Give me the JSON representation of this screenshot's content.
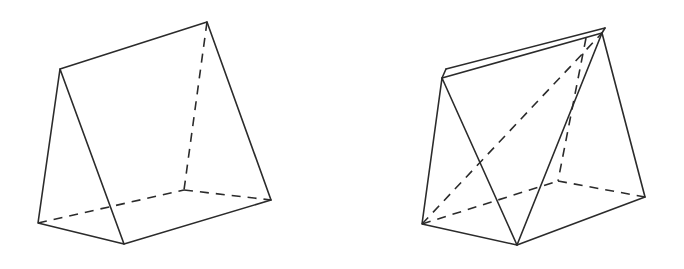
{
  "page": {
    "background_color": "#ffffff",
    "width": 684,
    "height": 269
  },
  "style": {
    "stroke_color": "#2b2b2b",
    "stroke_width": 1.6,
    "hidden_dash_pattern": "9 7",
    "fill_color": "#ffffff"
  },
  "figures": [
    {
      "id": "left-prism",
      "name": "triangular-prism-plain",
      "label": "",
      "vertices": {
        "front_apex": [
          60,
          69
        ],
        "front_bottom_left": [
          38,
          223
        ],
        "front_bottom_right": [
          124,
          244
        ],
        "back_apex": [
          207,
          22
        ],
        "back_bottom_left": [
          184,
          190
        ],
        "back_bottom_right": [
          271,
          200
        ]
      },
      "solid_edges": [
        [
          "front_apex",
          "front_bottom_left"
        ],
        [
          "front_apex",
          "front_bottom_right"
        ],
        [
          "front_bottom_left",
          "front_bottom_right"
        ],
        [
          "front_apex",
          "back_apex"
        ],
        [
          "back_apex",
          "back_bottom_right"
        ],
        [
          "front_bottom_right",
          "back_bottom_right"
        ]
      ],
      "hidden_edges": [
        [
          "back_apex",
          "back_bottom_left"
        ],
        [
          "back_bottom_left",
          "back_bottom_right"
        ],
        [
          "front_bottom_left",
          "back_bottom_left"
        ]
      ]
    },
    {
      "id": "right-prism",
      "name": "triangular-prism-with-inscribed-pyramid",
      "label": "",
      "vertices": {
        "front_apex": [
          442,
          78
        ],
        "front_apex_upper": [
          446,
          70
        ],
        "front_bottom_left": [
          422,
          224
        ],
        "front_bottom_mid": [
          517,
          245
        ],
        "back_apex": [
          602,
          33
        ],
        "back_apex_inner": [
          586,
          38
        ],
        "back_bottom_left": [
          558,
          181
        ],
        "back_bottom_right": [
          645,
          197
        ]
      },
      "solid_edges": [
        [
          "front_apex",
          "front_bottom_left"
        ],
        [
          "front_apex",
          "front_bottom_mid"
        ],
        [
          "front_bottom_left",
          "front_bottom_mid"
        ],
        [
          "front_apex",
          "back_apex_inner"
        ],
        [
          "front_apex_upper",
          "back_apex"
        ],
        [
          "front_apex",
          "front_apex_upper"
        ],
        [
          "back_apex_inner",
          "back_apex"
        ],
        [
          "front_bottom_mid",
          "back_apex"
        ],
        [
          "back_apex",
          "back_bottom_right"
        ],
        [
          "front_bottom_mid",
          "back_bottom_right"
        ]
      ],
      "hidden_edges": [
        [
          "front_bottom_left",
          "back_apex"
        ],
        [
          "front_bottom_left",
          "back_bottom_left"
        ],
        [
          "back_apex_inner",
          "back_bottom_left"
        ],
        [
          "back_bottom_left",
          "back_bottom_right"
        ]
      ]
    }
  ]
}
